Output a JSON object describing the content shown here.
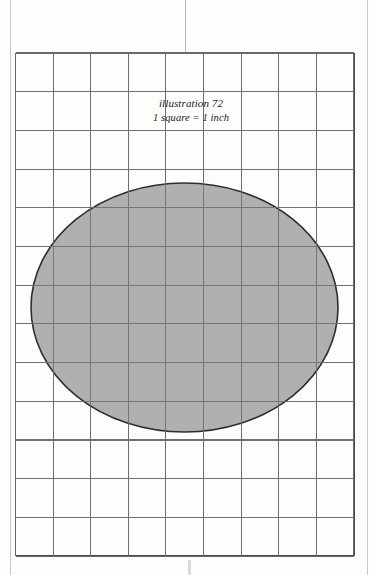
{
  "figure": {
    "caption_line1": "illustration 72",
    "caption_line2": "1 square = 1 inch",
    "colors": {
      "background": "#fdfdfc",
      "grid_line": "#6f6f6f",
      "grid_border": "#4a4a4a",
      "shape_fill": "#a9a9a9",
      "shape_stroke": "#2e2e2e",
      "fold_line": "#c8c8c8"
    }
  },
  "chart_data": {
    "type": "scatter",
    "title": "illustration 72",
    "subtitle": "1 square = 1 inch",
    "xlabel": "",
    "ylabel": "",
    "grid": true,
    "legend": "none",
    "grid_spec": {
      "columns": 9,
      "rows": 13,
      "square_side_inches": 1,
      "cell_width_px": 37.6,
      "cell_height_px": 38.7,
      "origin_x_px": 15.5,
      "origin_y_px": 53,
      "width_px": 338,
      "height_px": 503
    },
    "xlim": [
      0,
      9
    ],
    "ylim": [
      0,
      13
    ],
    "annotations": [
      {
        "text": "illustration 72",
        "x": 4.5,
        "y": 11.6
      },
      {
        "text": "1 square = 1 inch",
        "x": 4.5,
        "y": 11.25
      }
    ],
    "shapes": [
      {
        "kind": "ellipse",
        "label": "shaded-ellipse",
        "center_x_px": 184.5,
        "center_y_px": 307.5,
        "radius_x_px": 153.5,
        "radius_y_px": 124.5,
        "center_x_in": 4.49,
        "center_y_in": 6.57,
        "width_in": 8.17,
        "height_in": 6.43,
        "fill": "#a9a9a9",
        "stroke": "#2e2e2e",
        "stroke_width_px": 1.6
      }
    ]
  }
}
